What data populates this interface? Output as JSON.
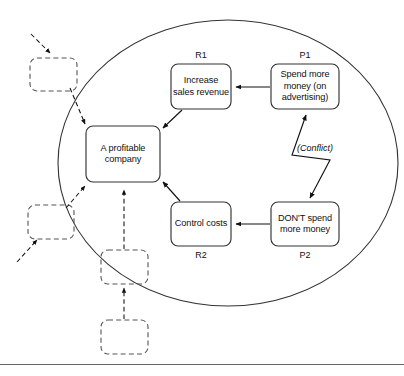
{
  "diagram": {
    "type": "evaporating-cloud-conflict-diagram",
    "boundary": {
      "shape": "ellipse",
      "name": "system-boundary"
    },
    "colors": {
      "stroke": "#333333",
      "dashed_stroke": "#555555",
      "text": "#111111",
      "background": "#ffffff",
      "rule": "#666666"
    },
    "nodes": [
      {
        "id": "objective",
        "label": "A profitable company",
        "tag": "",
        "style": "solid"
      },
      {
        "id": "r1",
        "label": "Increase sales revenue",
        "tag": "R1",
        "style": "solid"
      },
      {
        "id": "p1",
        "label": "Spend more money (on advertising)",
        "tag": "P1",
        "style": "solid"
      },
      {
        "id": "r2",
        "label": "Control costs",
        "tag": "R2",
        "style": "solid"
      },
      {
        "id": "p2",
        "label": "DON'T spend more money",
        "tag": "P2",
        "style": "solid"
      }
    ],
    "placeholder_nodes": [
      {
        "id": "ph-top-left",
        "label": "",
        "style": "dashed"
      },
      {
        "id": "ph-mid-left",
        "label": "",
        "style": "dashed"
      },
      {
        "id": "ph-lower-mid",
        "label": "",
        "style": "dashed"
      },
      {
        "id": "ph-bottom",
        "label": "",
        "style": "dashed"
      }
    ],
    "edges": [
      {
        "from": "p1",
        "to": "r1",
        "style": "solid",
        "arrow": "single"
      },
      {
        "from": "r1",
        "to": "objective",
        "style": "solid",
        "arrow": "single"
      },
      {
        "from": "p2",
        "to": "r2",
        "style": "solid",
        "arrow": "single"
      },
      {
        "from": "r2",
        "to": "objective",
        "style": "solid",
        "arrow": "single"
      },
      {
        "from": "p1",
        "to": "p2",
        "style": "solid",
        "arrow": "double",
        "label": "(Conflict)",
        "shape": "zigzag"
      },
      {
        "from": "ph-top-left",
        "to": "objective",
        "style": "dashed",
        "arrow": "single"
      },
      {
        "from": "ph-mid-left",
        "to": "objective",
        "style": "dashed",
        "arrow": "single"
      },
      {
        "from": "ph-lower-mid",
        "to": "objective",
        "style": "dashed",
        "arrow": "single"
      },
      {
        "from": "ph-bottom",
        "to": "ph-lower-mid",
        "style": "dashed",
        "arrow": "single"
      },
      {
        "from": "external-upper",
        "to": "ph-top-left",
        "style": "dashed",
        "arrow": "single"
      },
      {
        "from": "external-lower",
        "to": "ph-mid-left",
        "style": "dashed",
        "arrow": "single"
      }
    ],
    "conflict_label": "(Conflict)",
    "footer_rule": true
  }
}
